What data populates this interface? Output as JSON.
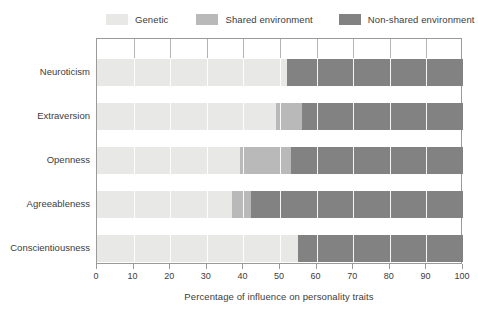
{
  "chart_data": {
    "type": "bar",
    "orientation": "horizontal",
    "stacked": true,
    "title": "",
    "xlabel": "Percentage of influence on personality traits",
    "ylabel": "",
    "xlim": [
      0,
      100
    ],
    "xticks": [
      0,
      10,
      20,
      30,
      40,
      50,
      60,
      70,
      80,
      90,
      100
    ],
    "xticklabels": [
      "0",
      "10",
      "20",
      "30",
      "40",
      "50",
      "60",
      "70",
      "80",
      "90",
      "100"
    ],
    "grid": "vertical-white-gridlines",
    "legend_position": "top",
    "categories": [
      "Neuroticism",
      "Extraversion",
      "Openness",
      "Agreeableness",
      "Conscientiousness"
    ],
    "series": [
      {
        "name": "Genetic",
        "color": "#e8e8e6",
        "values": [
          52,
          49,
          39,
          37,
          55
        ]
      },
      {
        "name": "Shared environment",
        "color": "#b9b9b9",
        "values": [
          0,
          7,
          14,
          5,
          0
        ]
      },
      {
        "name": "Non-shared environment",
        "color": "#828282",
        "values": [
          48,
          44,
          47,
          58,
          45
        ]
      }
    ]
  },
  "legend": {
    "items": [
      {
        "label": "Genetic",
        "color": "#e8e8e6"
      },
      {
        "label": "Shared environment",
        "color": "#b9b9b9"
      },
      {
        "label": "Non-shared environment",
        "color": "#828282"
      }
    ]
  },
  "axis": {
    "x_title": "Percentage of influence on personality traits",
    "x_tick_labels": [
      "0",
      "10",
      "20",
      "30",
      "40",
      "50",
      "60",
      "70",
      "80",
      "90",
      "100"
    ],
    "y_tick_labels": [
      "Neuroticism",
      "Extraversion",
      "Openness",
      "Agreeableness",
      "Conscientiousness"
    ]
  },
  "style": {
    "frame_color": "#9a9a9a",
    "gridline_color": "#ffffff",
    "text_color": "#3c3c3c",
    "background": "#ffffff"
  }
}
